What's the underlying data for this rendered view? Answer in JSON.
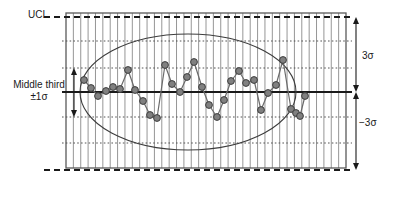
{
  "labels": {
    "ucl": "UCL",
    "middle_third": "Middle third",
    "one_sigma": "±1σ",
    "plus_three_sigma": "3σ",
    "minus_three_sigma": "−3σ"
  },
  "colors": {
    "line": "#6b6b6b",
    "marker_fill": "#808080",
    "marker_stroke": "#3d3d3d",
    "frame": "#5a5a5a",
    "grid": "#8a8a8a",
    "center_line": "#1a1a1a",
    "control_limit": "#1a1a1a",
    "sigma_guide": "#555555",
    "ellipse": "#3d3d3d",
    "arrow": "#1a1a1a",
    "text": "#1a1a1a",
    "background": "#ffffff"
  },
  "chart_data": {
    "type": "line",
    "title": "",
    "subtitle": "",
    "xlabel": "",
    "ylabel": "",
    "grid": true,
    "legend_position": "none",
    "xlim": [
      0,
      38
    ],
    "ylim": [
      -3.6,
      3.6
    ],
    "plot_box": {
      "x0": 66,
      "y0": 13,
      "x1": 346,
      "y1": 168
    },
    "gridlines": {
      "vertical_count": 38,
      "vertical_spacing_px": 7.368
    },
    "reference_lines": [
      {
        "name": "UCL",
        "label": "UCL",
        "value": 3,
        "y_px": 17,
        "style": "dashed",
        "width": 1.8
      },
      {
        "name": "plus-2-sigma",
        "label": "",
        "value": 2,
        "y_px": 41,
        "style": "dotted",
        "width": 1
      },
      {
        "name": "plus-1-sigma",
        "label": "",
        "value": 1,
        "y_px": 68,
        "style": "dotted",
        "width": 1
      },
      {
        "name": "center-line",
        "label": "",
        "value": 0,
        "y_px": 92,
        "style": "solid",
        "width": 1.8
      },
      {
        "name": "minus-1-sigma",
        "label": "",
        "value": -1,
        "y_px": 117,
        "style": "dotted",
        "width": 1
      },
      {
        "name": "minus-2-sigma",
        "label": "",
        "value": -2,
        "y_px": 143,
        "style": "dotted",
        "width": 1
      },
      {
        "name": "LCL",
        "label": "",
        "value": -3,
        "y_px": 170,
        "style": "dashed",
        "width": 1.8
      }
    ],
    "annotations": [
      {
        "name": "ellipse-highlight",
        "shape": "ellipse",
        "cx": 188,
        "cy": 92,
        "rx": 108,
        "ry": 58
      },
      {
        "name": "plus-3-sigma-arrow",
        "shape": "double-arrow",
        "x_px": 356,
        "y_top": 17,
        "y_bottom": 92,
        "label": "3σ"
      },
      {
        "name": "minus-3-sigma-arrow",
        "shape": "double-arrow",
        "x_px": 356,
        "y_top": 92,
        "y_bottom": 170,
        "label": "−3σ"
      },
      {
        "name": "middle-third-arrow",
        "shape": "double-arrow",
        "x_px": 74,
        "y_top": 68,
        "y_bottom": 117,
        "label": "±1σ"
      }
    ],
    "series": [
      {
        "name": "measurement",
        "marker": "circle",
        "marker_radius": 3.4,
        "x": [
          1,
          2,
          3,
          4,
          5,
          6,
          7,
          8,
          9,
          10,
          11,
          12,
          13,
          14,
          15,
          16,
          17,
          18,
          19,
          20,
          21,
          22,
          23,
          24,
          25,
          26,
          27,
          28,
          29,
          30,
          31,
          32
        ],
        "values": [
          0.72,
          0.42,
          -0.18,
          0.05,
          0.22,
          0.18,
          1.05,
          0.15,
          -0.35,
          -0.88,
          -1.02,
          1.22,
          0.55,
          0.02,
          0.62,
          1.3,
          0.22,
          -0.5,
          -1.05,
          -0.3,
          0.42,
          0.95,
          0.48,
          0.58,
          -0.72,
          -0.05,
          0.38,
          1.38,
          -0.6,
          -0.8,
          -0.92,
          -0.12
        ],
        "x_px": [
          84,
          91,
          98,
          106,
          113,
          120,
          128,
          135,
          143,
          150,
          157,
          165,
          172,
          180,
          187,
          194,
          202,
          209,
          217,
          224,
          231,
          239,
          246,
          254,
          261,
          268,
          276,
          283,
          291,
          296,
          300,
          305
        ],
        "y_px": [
          80,
          88,
          96,
          91,
          87,
          89,
          70,
          90,
          101,
          115,
          118,
          65,
          84,
          92,
          77,
          62,
          87,
          105,
          117,
          100,
          81,
          71,
          83,
          80,
          110,
          93,
          85,
          60,
          109,
          113,
          116,
          96
        ]
      }
    ]
  }
}
